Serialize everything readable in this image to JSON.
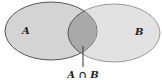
{
  "diagram": {
    "type": "venn",
    "sets": [
      {
        "label": "A",
        "fill": "#d6d6d6",
        "stroke": "#555555"
      },
      {
        "label": "B",
        "fill": "#e2e2e2",
        "stroke": "#999999"
      }
    ],
    "intersection": {
      "label": "A ∩ B",
      "fill": "#a8a8a8"
    }
  }
}
